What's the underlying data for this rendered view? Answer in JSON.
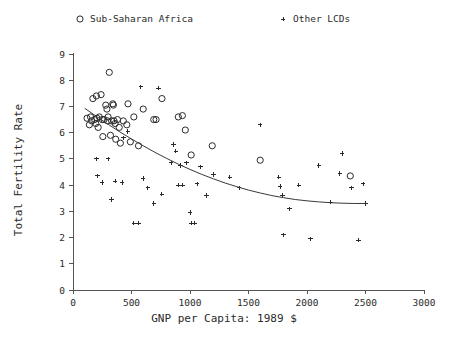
{
  "chart_data": {
    "type": "scatter",
    "title": "",
    "xlabel": "GNP per Capita: 1989 $",
    "ylabel": "Total Fertility Rate",
    "xlim": [
      0,
      3000
    ],
    "ylim": [
      0,
      9
    ],
    "xticks": [
      0,
      500,
      1000,
      1500,
      2000,
      2500,
      3000
    ],
    "yticks": [
      0,
      1,
      2,
      3,
      4,
      5,
      6,
      7,
      8,
      9
    ],
    "grid": false,
    "legend_position": "top",
    "legend": [
      {
        "label": "Sub-Saharan Africa",
        "marker": "circle"
      },
      {
        "label": "Other LCDs",
        "marker": "plus"
      }
    ],
    "series": [
      {
        "name": "Sub-Saharan Africa",
        "marker": "circle",
        "points": [
          [
            120,
            6.55
          ],
          [
            140,
            6.3
          ],
          [
            150,
            6.6
          ],
          [
            160,
            6.45
          ],
          [
            170,
            7.3
          ],
          [
            185,
            6.5
          ],
          [
            195,
            6.35
          ],
          [
            200,
            7.4
          ],
          [
            205,
            6.55
          ],
          [
            215,
            6.2
          ],
          [
            225,
            6.6
          ],
          [
            240,
            7.45
          ],
          [
            250,
            6.5
          ],
          [
            255,
            5.85
          ],
          [
            265,
            6.5
          ],
          [
            280,
            7.05
          ],
          [
            290,
            6.9
          ],
          [
            295,
            6.45
          ],
          [
            300,
            6.6
          ],
          [
            310,
            8.3
          ],
          [
            320,
            5.9
          ],
          [
            330,
            6.45
          ],
          [
            340,
            7.1
          ],
          [
            345,
            7.05
          ],
          [
            350,
            6.45
          ],
          [
            360,
            6.35
          ],
          [
            365,
            5.75
          ],
          [
            380,
            6.5
          ],
          [
            395,
            6.2
          ],
          [
            405,
            5.6
          ],
          [
            430,
            6.45
          ],
          [
            460,
            6.3
          ],
          [
            470,
            7.1
          ],
          [
            490,
            5.65
          ],
          [
            520,
            6.6
          ],
          [
            560,
            5.5
          ],
          [
            600,
            6.9
          ],
          [
            690,
            6.5
          ],
          [
            710,
            6.5
          ],
          [
            760,
            7.3
          ],
          [
            900,
            6.6
          ],
          [
            935,
            6.65
          ],
          [
            960,
            6.1
          ],
          [
            1010,
            5.15
          ],
          [
            1190,
            5.5
          ],
          [
            1600,
            4.95
          ],
          [
            2370,
            4.35
          ]
        ]
      },
      {
        "name": "Other LCDs",
        "marker": "plus",
        "points": [
          [
            200,
            5.0
          ],
          [
            210,
            4.35
          ],
          [
            250,
            4.1
          ],
          [
            300,
            5.0
          ],
          [
            330,
            3.45
          ],
          [
            360,
            4.15
          ],
          [
            420,
            4.1
          ],
          [
            430,
            5.8
          ],
          [
            470,
            6.05
          ],
          [
            520,
            2.55
          ],
          [
            560,
            2.55
          ],
          [
            580,
            7.75
          ],
          [
            600,
            4.25
          ],
          [
            640,
            3.9
          ],
          [
            690,
            3.3
          ],
          [
            730,
            7.7
          ],
          [
            760,
            3.65
          ],
          [
            840,
            4.85
          ],
          [
            860,
            5.55
          ],
          [
            880,
            5.3
          ],
          [
            900,
            4.0
          ],
          [
            920,
            4.75
          ],
          [
            940,
            4.0
          ],
          [
            970,
            4.85
          ],
          [
            1000,
            2.95
          ],
          [
            1010,
            2.55
          ],
          [
            1040,
            2.55
          ],
          [
            1060,
            4.05
          ],
          [
            1090,
            4.7
          ],
          [
            1140,
            3.6
          ],
          [
            1200,
            4.4
          ],
          [
            1340,
            4.3
          ],
          [
            1420,
            3.9
          ],
          [
            1600,
            6.3
          ],
          [
            1760,
            4.3
          ],
          [
            1770,
            3.95
          ],
          [
            1790,
            3.6
          ],
          [
            1800,
            2.1
          ],
          [
            1850,
            3.1
          ],
          [
            1930,
            4.0
          ],
          [
            2030,
            1.95
          ],
          [
            2100,
            4.75
          ],
          [
            2200,
            3.35
          ],
          [
            2280,
            4.45
          ],
          [
            2300,
            5.2
          ],
          [
            2380,
            3.9
          ],
          [
            2440,
            1.9
          ],
          [
            2480,
            4.05
          ],
          [
            2500,
            3.3
          ]
        ]
      }
    ],
    "fit_curve": {
      "name": "fitted-trend",
      "points": [
        [
          100,
          6.93
        ],
        [
          200,
          6.62
        ],
        [
          300,
          6.32
        ],
        [
          400,
          6.03
        ],
        [
          500,
          5.76
        ],
        [
          600,
          5.5
        ],
        [
          700,
          5.25
        ],
        [
          800,
          5.02
        ],
        [
          900,
          4.8
        ],
        [
          1000,
          4.6
        ],
        [
          1100,
          4.41
        ],
        [
          1200,
          4.24
        ],
        [
          1300,
          4.08
        ],
        [
          1400,
          3.94
        ],
        [
          1500,
          3.81
        ],
        [
          1600,
          3.7
        ],
        [
          1700,
          3.6
        ],
        [
          1800,
          3.52
        ],
        [
          1900,
          3.45
        ],
        [
          2000,
          3.4
        ],
        [
          2100,
          3.36
        ],
        [
          2200,
          3.33
        ],
        [
          2300,
          3.31
        ],
        [
          2400,
          3.3
        ],
        [
          2500,
          3.3
        ]
      ]
    }
  }
}
